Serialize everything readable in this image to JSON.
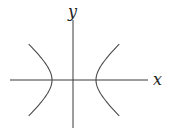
{
  "diagram": {
    "type": "hyperbola",
    "axes": {
      "x_label": "x",
      "y_label": "y"
    },
    "branches": [
      {
        "name": "left-branch",
        "opens": "left"
      },
      {
        "name": "right-branch",
        "opens": "right"
      }
    ],
    "colors": {
      "axis": "#3a3a3a",
      "curve": "#4a4a4a",
      "background": "#ffffff"
    }
  }
}
